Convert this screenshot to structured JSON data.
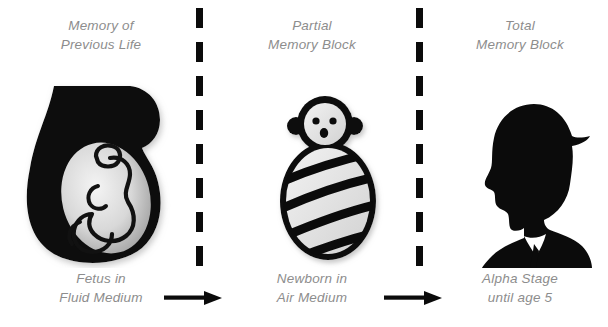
{
  "diagram": {
    "background_color": "#ffffff",
    "label_color": "#8d8d8d",
    "figure_color": "#0b0b0b",
    "divider_color": "#0b0b0b"
  },
  "stages": [
    {
      "id": "stage-fetus",
      "top_label": "Memory of\nPrevious Life",
      "bottom_label": "Fetus in\nFluid Medium",
      "figure": "womb-fetus-icon"
    },
    {
      "id": "stage-newborn",
      "top_label": "Partial\nMemory Block",
      "bottom_label": "Newborn in\nAir Medium",
      "figure": "swaddled-newborn-icon"
    },
    {
      "id": "stage-child",
      "top_label": "Total\nMemory Block",
      "bottom_label": "Alpha Stage\nuntil age 5",
      "figure": "child-silhouette-icon"
    }
  ],
  "dividers": [
    {
      "id": "divider-1",
      "style": "dashed-vertical"
    },
    {
      "id": "divider-2",
      "style": "dashed-vertical"
    }
  ],
  "arrows": [
    {
      "id": "arrow-1",
      "direction": "right"
    },
    {
      "id": "arrow-2",
      "direction": "right"
    }
  ]
}
